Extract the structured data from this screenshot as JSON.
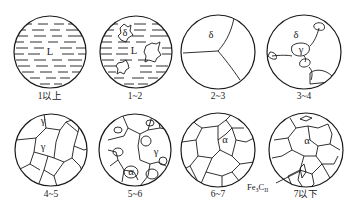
{
  "diagram": {
    "title": "",
    "panels": [
      {
        "id": "p1",
        "caption": "1以上",
        "phases": [
          "L"
        ]
      },
      {
        "id": "p2",
        "caption": "1~2",
        "phases": [
          "δ",
          "L"
        ]
      },
      {
        "id": "p3",
        "caption": "2~3",
        "phases": [
          "δ"
        ]
      },
      {
        "id": "p4",
        "caption": "3~4",
        "phases": [
          "δ",
          "γ"
        ]
      },
      {
        "id": "p5",
        "caption": "4~5",
        "phases": [
          "γ"
        ]
      },
      {
        "id": "p6",
        "caption": "5~6",
        "phases": [
          "γ",
          "α"
        ]
      },
      {
        "id": "p7",
        "caption": "6~7",
        "phases": [
          "α"
        ]
      },
      {
        "id": "p8",
        "caption": "7以下",
        "phases": [
          "α"
        ],
        "annotation": {
          "base": "Fe",
          "sub1": "3",
          "mid": "C",
          "sub2": "II"
        }
      }
    ]
  }
}
